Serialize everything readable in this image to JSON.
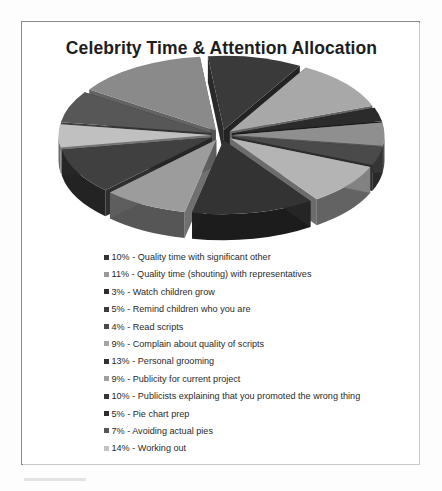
{
  "chart_data": {
    "type": "pie",
    "title": "Celebrity Time & Attention Allocation",
    "exploded": true,
    "three_d": true,
    "legend_position": "bottom",
    "units": "percent",
    "total": 100,
    "categories": [
      "Quality time with significant other",
      "Quality time (shouting) with representatives",
      "Watch children grow",
      "Remind children who you are",
      "Read scripts",
      "Complain about quality of scripts",
      "Personal grooming",
      "Publicity for current project",
      "Publicists explaining that you promoted the wrong thing",
      "Pie chart prep",
      "Avoiding actual pies",
      "Working out"
    ],
    "values": [
      10,
      11,
      3,
      5,
      4,
      9,
      13,
      9,
      10,
      5,
      7,
      14
    ],
    "slice_colors": [
      "#3a3a3a",
      "#a8a8a8",
      "#2b2b2b",
      "#8f8f8f",
      "#4a4a4a",
      "#b4b4b4",
      "#333333",
      "#9c9c9c",
      "#404040",
      "#c0c0c0",
      "#575757",
      "#8a8a8a"
    ]
  },
  "legend": {
    "items": [
      {
        "label": "10% - Quality time with significant other",
        "swatch": "#333333"
      },
      {
        "label": "11% - Quality time (shouting) with representatives",
        "swatch": "#9a9a9a"
      },
      {
        "label": "3% - Watch children grow",
        "swatch": "#2d2d2d"
      },
      {
        "label": "5% - Remind children who you are",
        "swatch": "#3b3b3b"
      },
      {
        "label": "4% - Read scripts",
        "swatch": "#4a4a4a"
      },
      {
        "label": "9% - Complain about quality of scripts",
        "swatch": "#a5a5a5"
      },
      {
        "label": "13% - Personal grooming",
        "swatch": "#303030"
      },
      {
        "label": "9% - Publicity for current project",
        "swatch": "#9f9f9f"
      },
      {
        "label": "10% - Publicists explaining that you promoted the wrong thing",
        "swatch": "#373737"
      },
      {
        "label": "5% - Pie chart prep",
        "swatch": "#2e2e2e"
      },
      {
        "label": "7% - Avoiding actual pies",
        "swatch": "#555555"
      },
      {
        "label": "14% - Working out",
        "swatch": "#c3c3c3"
      }
    ]
  }
}
